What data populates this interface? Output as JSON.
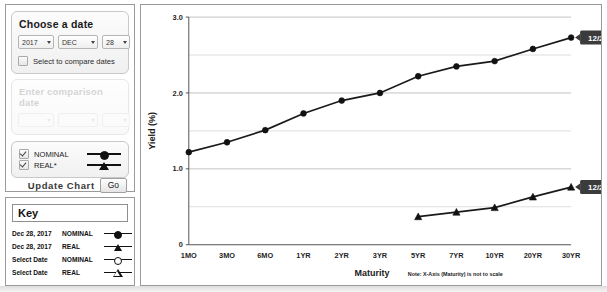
{
  "date_picker": {
    "title": "Choose a date",
    "year": "2017",
    "month": "DEC",
    "day": "28",
    "compare_checkbox_label": "Select to compare dates",
    "compare_checked": false
  },
  "comparison": {
    "title": "Enter comparison date",
    "year": "",
    "month": "",
    "day": "",
    "enabled": false
  },
  "series_toggles": [
    {
      "label": "NOMINAL",
      "checked": true,
      "marker": "filled-circle"
    },
    {
      "label": "REAL*",
      "checked": true,
      "marker": "filled-triangle"
    }
  ],
  "update": {
    "label": "Update Chart",
    "button": "Go"
  },
  "key": {
    "title": "Key",
    "rows": [
      {
        "date": "Dec 28, 2017",
        "type": "NOMINAL",
        "marker": "filled-circle"
      },
      {
        "date": "Dec 28, 2017",
        "type": "REAL",
        "marker": "filled-triangle"
      },
      {
        "date": "Select Date",
        "type": "NOMINAL",
        "marker": "hollow-circle"
      },
      {
        "date": "Select Date",
        "type": "REAL",
        "marker": "hollow-triangle"
      }
    ]
  },
  "chart_data": {
    "type": "line",
    "title": "",
    "xlabel": "Maturity",
    "ylabel": "Yield (%)",
    "note": "Note: X-Axis (Maturity) is not to scale",
    "categories": [
      "1MO",
      "3MO",
      "6MO",
      "1YR",
      "2YR",
      "3YR",
      "5YR",
      "7YR",
      "10YR",
      "20YR",
      "30YR"
    ],
    "ylim": [
      0,
      3.0
    ],
    "yticks": [
      "0",
      "1.0",
      "2.0",
      "3.0"
    ],
    "ytick_values": [
      0,
      1.0,
      2.0,
      3.0
    ],
    "minor_gridlines": [
      0.5,
      1.5,
      2.5
    ],
    "grid": true,
    "legend_position": "none",
    "series": [
      {
        "name": "NOMINAL",
        "marker": "filled-circle",
        "annotation": "12/28/2017",
        "x": [
          "1MO",
          "3MO",
          "6MO",
          "1YR",
          "2YR",
          "3YR",
          "5YR",
          "7YR",
          "10YR",
          "20YR",
          "30YR"
        ],
        "values": [
          1.22,
          1.35,
          1.51,
          1.73,
          1.9,
          2.0,
          2.22,
          2.35,
          2.42,
          2.58,
          2.73
        ]
      },
      {
        "name": "REAL",
        "marker": "filled-triangle",
        "annotation": "12/28/2017",
        "x": [
          "5YR",
          "7YR",
          "10YR",
          "20YR",
          "30YR"
        ],
        "values": [
          0.37,
          0.43,
          0.49,
          0.63,
          0.76
        ]
      }
    ]
  }
}
